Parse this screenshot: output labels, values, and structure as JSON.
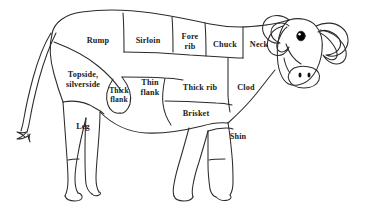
{
  "diagram": {
    "orientation": "facing right",
    "style": "black line drawing on white background",
    "line_color": "#2b2b2b",
    "background_color": "#ffffff",
    "text_color": "#1a1a1a",
    "eye_color": "#000000"
  },
  "cuts": [
    {
      "id": "rump",
      "label": "Rump",
      "lines": [
        "Rump"
      ],
      "x": 98,
      "y": 41
    },
    {
      "id": "sirloin",
      "label": "Sirloin",
      "lines": [
        "Sirloin"
      ],
      "x": 148,
      "y": 41
    },
    {
      "id": "fore-rib",
      "label": "Fore rib",
      "lines": [
        "Fore",
        "rib"
      ],
      "x": 190,
      "y": 41
    },
    {
      "id": "chuck",
      "label": "Chuck",
      "lines": [
        "Chuck"
      ],
      "x": 225,
      "y": 45
    },
    {
      "id": "neck",
      "label": "Neck",
      "lines": [
        "Neck"
      ],
      "x": 259,
      "y": 45
    },
    {
      "id": "topside-silverside",
      "label": "Topside, silverside",
      "lines": [
        "Topside,",
        "silverside"
      ],
      "x": 83,
      "y": 79
    },
    {
      "id": "thick-flank",
      "label": "Thick flank",
      "lines": [
        "Thick",
        "flank"
      ],
      "x": 119,
      "y": 95
    },
    {
      "id": "thin-flank",
      "label": "Thin flank",
      "lines": [
        "Thin",
        "flank"
      ],
      "x": 150,
      "y": 87
    },
    {
      "id": "thick-rib",
      "label": "Thick rib",
      "lines": [
        "Thick rib"
      ],
      "x": 200,
      "y": 88
    },
    {
      "id": "clod",
      "label": "Clod",
      "lines": [
        "Clod"
      ],
      "x": 246,
      "y": 88
    },
    {
      "id": "brisket",
      "label": "Brisket",
      "lines": [
        "Brisket"
      ],
      "x": 196,
      "y": 114
    },
    {
      "id": "leg",
      "label": "Leg",
      "lines": [
        "Leg"
      ],
      "x": 83,
      "y": 127
    },
    {
      "id": "shin",
      "label": "Shin",
      "lines": [
        "Shin"
      ],
      "x": 238,
      "y": 137
    }
  ]
}
